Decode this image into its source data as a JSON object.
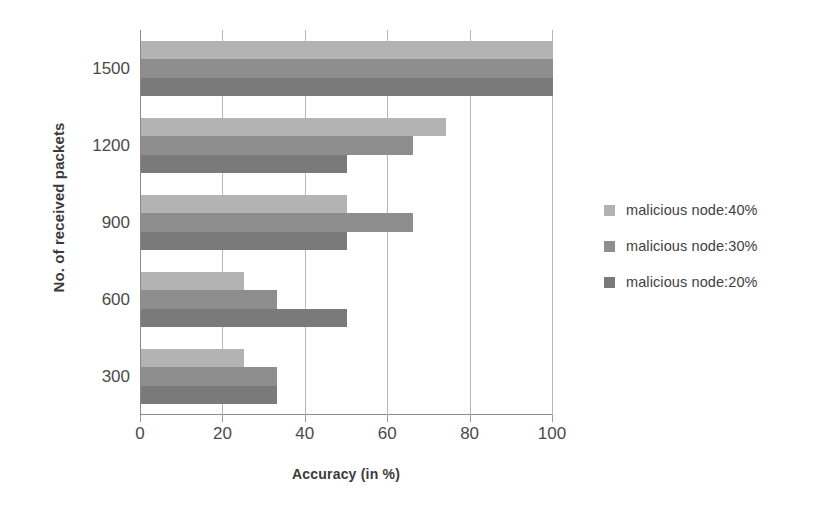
{
  "chart_data": {
    "type": "bar",
    "orientation": "horizontal",
    "title": "",
    "xlabel": "Accuracy (in %)",
    "ylabel": "No. of received packets",
    "categories": [
      "300",
      "600",
      "900",
      "1200",
      "1500"
    ],
    "xticks": [
      "0",
      "20",
      "40",
      "60",
      "80",
      "100"
    ],
    "xlim": [
      0,
      100
    ],
    "grid": "vertical",
    "legend_position": "right",
    "series": [
      {
        "name": "malicious node:40%",
        "color": "#b3b3b3",
        "values": [
          25,
          25,
          50,
          74,
          100
        ]
      },
      {
        "name": "malicious node:30%",
        "color": "#8e8e8e",
        "values": [
          33,
          33,
          66,
          66,
          100
        ]
      },
      {
        "name": "malicious node:20%",
        "color": "#7a7a7a",
        "values": [
          33,
          50,
          50,
          50,
          100
        ]
      }
    ]
  },
  "axis": {
    "x_title": "Accuracy (in %)",
    "y_title": "No. of received packets"
  },
  "legend": {
    "items": [
      {
        "label": "malicious node:40%",
        "color": "#b3b3b3"
      },
      {
        "label": "malicious node:30%",
        "color": "#8e8e8e"
      },
      {
        "label": "malicious node:20%",
        "color": "#7a7a7a"
      }
    ]
  },
  "colors": {
    "grid": "#b8b8b8",
    "axis": "#8a8a8a",
    "text": "#3b3b3b",
    "background": "#ffffff"
  }
}
